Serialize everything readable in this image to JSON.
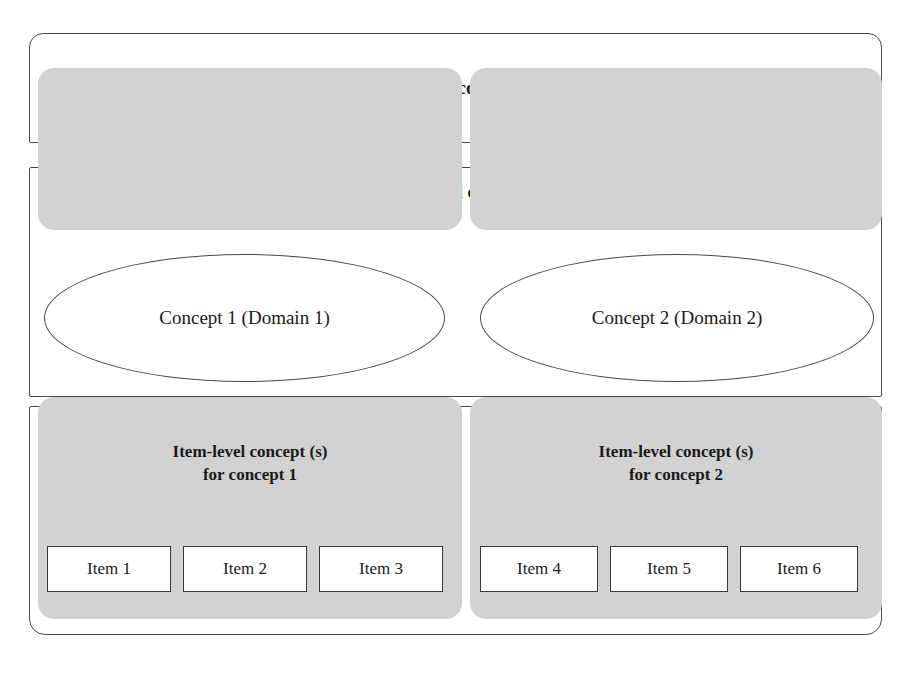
{
  "diagram": {
    "colors": {
      "panel_fill": "#d2d2d2",
      "outline": "#4a4a4a",
      "background": "#ffffff",
      "text": "#1a1a1a"
    },
    "levels": {
      "overall": {
        "label": "Overall concept"
      },
      "domain": {
        "label": "Domain-level concept (s)",
        "concepts": [
          {
            "label": "Concept 1 (Domain 1)"
          },
          {
            "label": "Concept 2 (Domain 2)"
          }
        ]
      },
      "item": {
        "groups": [
          {
            "label": "Item-level concept (s)\nfor concept 1",
            "items": [
              {
                "label": "Item 1"
              },
              {
                "label": "Item 2"
              },
              {
                "label": "Item 3"
              }
            ]
          },
          {
            "label": "Item-level concept (s)\nfor concept 2",
            "items": [
              {
                "label": "Item 4"
              },
              {
                "label": "Item 5"
              },
              {
                "label": "Item 6"
              }
            ]
          }
        ]
      }
    }
  }
}
